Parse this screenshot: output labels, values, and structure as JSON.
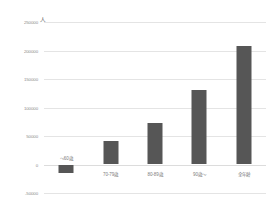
{
  "chart_data": {
    "type": "bar",
    "title": "",
    "subtitle": "",
    "xlabel": "",
    "ylabel": "人",
    "unit_label": "人",
    "categories": [
      "～60歳",
      "70-79歳",
      "80-89歳",
      "90歳～",
      "全年齢"
    ],
    "values": [
      -15000,
      42000,
      73000,
      130000,
      208000
    ],
    "ylim": [
      -50000,
      250000
    ],
    "yticks": [
      250000,
      200000,
      150000,
      100000,
      50000,
      0,
      -50000
    ],
    "ytick_labels": [
      "250000",
      "200000",
      "150000",
      "100000",
      "50000",
      "0",
      "-50000"
    ],
    "grid": true,
    "legend": "none",
    "bar_color": "#565656",
    "gridline_color": "#e4e4e4",
    "axis_text_color": "#8a8a8a",
    "background_color": "#ffffff"
  }
}
